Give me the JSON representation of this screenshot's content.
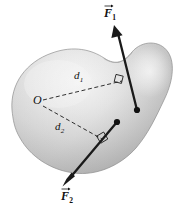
{
  "figure": {
    "background_color": "#ffffff",
    "width": 178,
    "height": 217
  },
  "body_shape": {
    "name": "kidney-shaped rigid body",
    "fill_light": "#f2f2f2",
    "fill_mid": "#cfcfcf",
    "fill_dark": "#a8a8a8",
    "outline_color": "#8c8c8c"
  },
  "pivot": {
    "label": "O",
    "x": 37,
    "y": 101
  },
  "forces": [
    {
      "id": "F1",
      "label": "F",
      "subscript": "1",
      "label_x": 105,
      "label_y": 6,
      "tail_x": 137,
      "tail_y": 110,
      "tip_x": 114,
      "tip_y": 26,
      "color": "#1a1a1a",
      "application_point_x": 137,
      "application_point_y": 110
    },
    {
      "id": "F2",
      "label": "F",
      "subscript": "2",
      "label_x": 62,
      "label_y": 192,
      "tail_x": 117,
      "tail_y": 122,
      "tip_x": 63,
      "tip_y": 186,
      "color": "#1a1a1a",
      "application_point_x": 117,
      "application_point_y": 122
    }
  ],
  "moment_arms": [
    {
      "id": "d1",
      "label": "d",
      "subscript": "1",
      "label_x": 76,
      "label_y": 72,
      "from_x": 43,
      "from_y": 100,
      "to_x": 122,
      "to_y": 81,
      "line_style": "dashed",
      "color": "#1a1a1a",
      "right_angle": true
    },
    {
      "id": "d2",
      "label": "d",
      "subscript": "2",
      "label_x": 57,
      "label_y": 123,
      "from_x": 43,
      "from_y": 106,
      "to_x": 102,
      "to_y": 139,
      "line_style": "dashed",
      "color": "#1a1a1a",
      "right_angle": true
    }
  ]
}
